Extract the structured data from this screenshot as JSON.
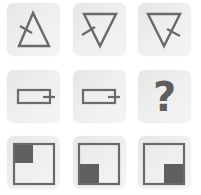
{
  "puzzle": {
    "type": "3x3 matrix reasoning",
    "stroke_color": "#6a6a6a",
    "fill_color": "#5f5f5f",
    "cells": [
      {
        "row": 1,
        "col": 1,
        "shape": "triangle-up",
        "tick": "left-side"
      },
      {
        "row": 1,
        "col": 2,
        "shape": "triangle-down",
        "tick": "left-side"
      },
      {
        "row": 1,
        "col": 3,
        "shape": "triangle-down",
        "tick": "right-side"
      },
      {
        "row": 2,
        "col": 1,
        "shape": "rectangle",
        "tick": "right-side"
      },
      {
        "row": 2,
        "col": 2,
        "shape": "rectangle",
        "tick": "right-side"
      },
      {
        "row": 2,
        "col": 3,
        "shape": "unknown",
        "label": "?"
      },
      {
        "row": 3,
        "col": 1,
        "shape": "square",
        "filled_quadrant": "top-left"
      },
      {
        "row": 3,
        "col": 2,
        "shape": "square",
        "filled_quadrant": "bottom-left"
      },
      {
        "row": 3,
        "col": 3,
        "shape": "square",
        "filled_quadrant": "bottom-right"
      }
    ]
  }
}
